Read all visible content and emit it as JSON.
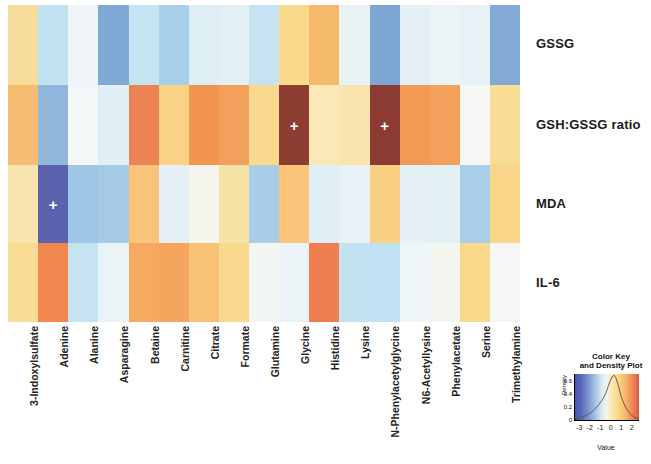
{
  "chart_data": {
    "type": "heatmap",
    "title": "",
    "xlabel": "",
    "ylabel": "",
    "columns": [
      "3-Indoxylsulfate",
      "Adenine",
      "Alanine",
      "Asparagine",
      "Betaine",
      "Carnitine",
      "Citrate",
      "Formate",
      "Glutamine",
      "Glycine",
      "Histidine",
      "Lysine",
      "N-Phenylacetylglycine",
      "N6-Acetyllysine",
      "Phenylacetate",
      "Serine",
      "Trimethylamine"
    ],
    "rows": [
      "GSSG",
      "GSH:GSSG ratio",
      "MDA",
      "IL-6"
    ],
    "values": [
      [
        0.55,
        -0.75,
        -0.15,
        -1.35,
        -0.7,
        -1.05,
        -0.55,
        -0.5,
        -1.35,
        0.8,
        1.15,
        -0.25,
        -1.4,
        -0.35,
        -0.25,
        -0.3,
        -1.3
      ],
      [
        1.25,
        -1.2,
        -0.55,
        -0.3,
        1.8,
        0.95,
        1.55,
        1.45,
        0.85,
        2.55,
        0.4,
        0.25,
        2.6,
        1.5,
        1.45,
        -0.55,
        0.7
      ],
      [
        0.45,
        -2.55,
        -1.1,
        -1.15,
        1.1,
        -0.35,
        0.1,
        0.55,
        -1.05,
        1.05,
        -0.4,
        -0.35,
        0.95,
        -0.3,
        -0.45,
        -1.0,
        0.85
      ],
      [
        1.0,
        1.7,
        -1.05,
        -0.45,
        1.5,
        1.55,
        1.25,
        0.85,
        0.15,
        -0.3,
        1.9,
        -1.05,
        -1.15,
        -0.25,
        0.05,
        0.95,
        0.1
      ]
    ],
    "cell_colors": [
      [
        "#f6dd9b",
        "#c2e2f1",
        "#f0f6f7",
        "#7fa8d4",
        "#c6e3f2",
        "#a8cfe8",
        "#ddeef5",
        "#e2eff5",
        "#c5e3f2",
        "#f9d98c",
        "#f5b96b",
        "#e9f3f6",
        "#7da6d3",
        "#e4f0f6",
        "#eaf3f6",
        "#e7f1f6",
        "#82aad5"
      ],
      [
        "#f6bd72",
        "#90b6dc",
        "#f2f7f7",
        "#e0eef5",
        "#ed8355",
        "#f9d286",
        "#f1954f",
        "#f2a05b",
        "#f8d98d",
        "#8e3d33",
        "#fae8b6",
        "#fae4ad",
        "#8c3b32",
        "#f19b57",
        "#f2a05b",
        "#f4f7f3",
        "#f9dd94"
      ],
      [
        "#f8e5ad",
        "#5b62ae",
        "#9fc6e4",
        "#a5cae6",
        "#f9c379",
        "#e4f0f6",
        "#f5f6ed",
        "#f8e3a6",
        "#a8cde7",
        "#f9c47a",
        "#e0eef5",
        "#e7f1f6",
        "#f8cf83",
        "#e6f1f6",
        "#e2eff5",
        "#a9cee7",
        "#f9d489"
      ],
      [
        "#f9dd95",
        "#f1874f",
        "#c6e3f2",
        "#eaf3f6",
        "#f6aa60",
        "#f5a55d",
        "#f8c276",
        "#f9d98d",
        "#f3f7f4",
        "#ebf3f6",
        "#ef7d50",
        "#c1e2f1",
        "#c0e1f1",
        "#eff6f7",
        "#f5f6ef",
        "#f8d88b",
        "#f4f7f5"
      ]
    ],
    "marked_cells": [
      {
        "row": "GSH:GSSG ratio",
        "column": "Glycine",
        "marker": "+"
      },
      {
        "row": "GSH:GSSG ratio",
        "column": "N-Phenylacetylglycine",
        "marker": "+"
      },
      {
        "row": "MDA",
        "column": "Adenine",
        "marker": "+"
      }
    ],
    "marker_symbol": "+",
    "color_key": {
      "title_line1": "Color Key",
      "title_line2": "and Density Plot",
      "xlabel": "Value",
      "ylabel": "Density",
      "xticks": [
        "-3",
        "-2",
        "-1",
        "0",
        "1",
        "2"
      ],
      "xlim": [
        -3.4,
        2.7
      ],
      "yticks": [
        "0.6",
        "0.4",
        "0.2",
        "0"
      ],
      "ylim": [
        0,
        0.7
      ],
      "colormap_low": "#4a52a8",
      "colormap_mid": "#f2f5e8",
      "colormap_high": "#d8543f"
    },
    "legend_position": "bottom-right",
    "grid": false
  }
}
